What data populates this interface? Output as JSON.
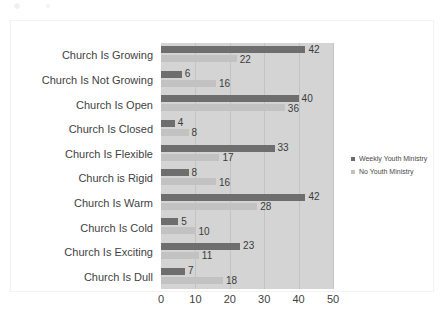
{
  "chart_data": {
    "type": "bar",
    "orientation": "horizontal",
    "title": "",
    "subtitle": "",
    "xlabel": "",
    "ylabel": "",
    "xlim": [
      0,
      50
    ],
    "xticks": [
      0,
      10,
      20,
      30,
      40,
      50
    ],
    "grid": true,
    "grid_axis": "x",
    "legend_position": "right",
    "show_value_labels": true,
    "categories": [
      "Church Is Growing",
      "Church Is Not Growing",
      "Church Is Open",
      "Church Is Closed",
      "Church Is Flexible",
      "Church is Rigid",
      "Church Is Warm",
      "Church Is Cold",
      "Church Is Exciting",
      "Church Is Dull"
    ],
    "series": [
      {
        "name": "Weekly Youth Ministry",
        "color": "#6e6e6e",
        "values": [
          42,
          6,
          40,
          4,
          33,
          8,
          42,
          5,
          23,
          7
        ]
      },
      {
        "name": "No Youth Ministry",
        "color": "#c2c2c2",
        "values": [
          22,
          16,
          36,
          8,
          17,
          16,
          28,
          10,
          11,
          18
        ]
      }
    ],
    "plot_background": "#d4d4d4",
    "figure_background": "#ffffff"
  }
}
